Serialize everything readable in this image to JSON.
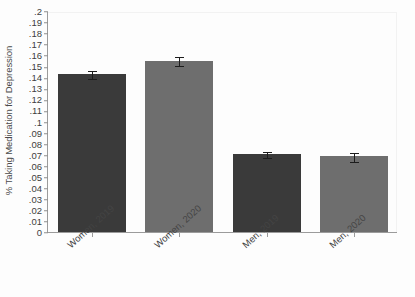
{
  "chart_data": {
    "type": "bar",
    "title": "",
    "subtitle": "",
    "xlabel": "",
    "ylabel": "% Taking Medication for Depression",
    "categories": [
      "Women, 2019",
      "Women, 2020",
      "Men, 2019",
      "Men, 2020"
    ],
    "values": [
      0.143,
      0.155,
      0.0705,
      0.0685
    ],
    "errors_upper": [
      0.147,
      0.159,
      0.0735,
      0.0725
    ],
    "errors_lower": [
      0.139,
      0.151,
      0.0675,
      0.0645
    ],
    "series": [
      {
        "name": "% Taking Medication for Depression",
        "values": [
          0.143,
          0.155,
          0.0705,
          0.0685
        ]
      }
    ],
    "bar_colors": [
      "#3a3a3a",
      "#6e6e6e",
      "#3a3a3a",
      "#6e6e6e"
    ],
    "ylim": [
      0,
      0.2
    ],
    "ytick_values": [
      0,
      0.01,
      0.02,
      0.03,
      0.04,
      0.05,
      0.06,
      0.07,
      0.08,
      0.09,
      0.1,
      0.11,
      0.12,
      0.13,
      0.14,
      0.15,
      0.16,
      0.17,
      0.18,
      0.19,
      0.2
    ],
    "ytick_labels": [
      "0",
      ".01",
      ".02",
      ".03",
      ".04",
      ".05",
      ".06",
      ".07",
      ".08",
      ".09",
      ".1",
      ".11",
      ".12",
      ".13",
      ".14",
      ".15",
      ".16",
      ".17",
      ".18",
      ".19",
      ".2"
    ],
    "grid": false,
    "legend": "none",
    "error_bars": true,
    "xlabel_rotation": -42
  },
  "axis": {
    "y_title": "% Taking Medication for Depression",
    "axis_color": "#9b9b9b",
    "tick_color": "#8f8f8f",
    "text_color": "#3d3d3d"
  },
  "figure": {
    "background": "#fdfdfd"
  }
}
